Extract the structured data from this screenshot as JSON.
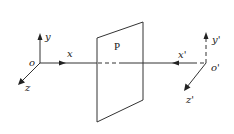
{
  "diagram": {
    "type": "coordinate-systems-mirror-plane",
    "plane": {
      "label": "P"
    },
    "frame_left": {
      "origin_label": "o",
      "x_label": "x",
      "y_label": "y",
      "z_label": "z"
    },
    "frame_right": {
      "origin_label": "o'",
      "x_label": "x'",
      "y_label": "y'",
      "z_label": "z'"
    },
    "colors": {
      "stroke": "#333333",
      "background": "#ffffff"
    }
  }
}
